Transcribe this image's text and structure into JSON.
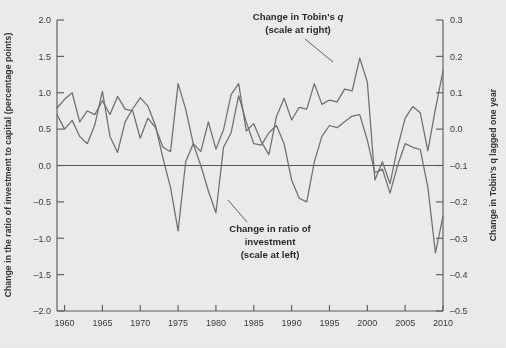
{
  "chart_data": {
    "type": "line",
    "title": "",
    "xlabel": "",
    "ylabel": "Change in the ratio of investment to capital (percentage points)",
    "y2label": "Change in Tobin's q lagged one year",
    "grid": false,
    "legend_position": "inline-annotations",
    "xlim": [
      1959,
      2010
    ],
    "ylim": [
      -2.0,
      2.0
    ],
    "y2lim": [
      -0.5,
      0.3
    ],
    "xticks": [
      1960,
      1965,
      1970,
      1975,
      1980,
      1985,
      1990,
      1995,
      2000,
      2005,
      2010
    ],
    "yticks": [
      -2.0,
      -1.5,
      -1.0,
      -0.5,
      0.0,
      0.5,
      1.0,
      1.5,
      2.0
    ],
    "yticklabels": [
      "-2.0",
      "-1.5",
      "-1.0",
      "-0.5",
      "0.0",
      "0.5",
      "1.0",
      "1.5",
      "2.0"
    ],
    "y2ticks": [
      -0.5,
      -0.4,
      -0.3,
      -0.2,
      -0.1,
      0.0,
      0.1,
      0.2,
      0.3
    ],
    "y2ticklabels": [
      "-0.5",
      "-0.4",
      "-0.3",
      "-0.2",
      "-0.1",
      "0.0",
      "0.1",
      "0.2",
      "0.3"
    ],
    "zero_line": 0.0,
    "line_color": "#6f6f70",
    "axis_color": "#5d5d5e",
    "background": "#ebebec",
    "series": [
      {
        "name": "Change in ratio of investment",
        "axis": "left",
        "x": [
          1959,
          1960,
          1961,
          1962,
          1963,
          1964,
          1965,
          1966,
          1967,
          1968,
          1969,
          1970,
          1971,
          1972,
          1973,
          1974,
          1975,
          1976,
          1977,
          1978,
          1979,
          1980,
          1981,
          1982,
          1983,
          1984,
          1985,
          1986,
          1987,
          1988,
          1989,
          1990,
          1991,
          1992,
          1993,
          1994,
          1995,
          1996,
          1997,
          1998,
          1999,
          2000,
          2001,
          2002,
          2003,
          2004,
          2005,
          2006,
          2007,
          2008,
          2009,
          2010
        ],
        "values": [
          0.7,
          0.5,
          0.62,
          0.4,
          0.3,
          0.56,
          1.02,
          0.4,
          0.18,
          0.6,
          0.78,
          0.93,
          0.82,
          0.55,
          0.1,
          -0.3,
          -0.9,
          0.05,
          0.3,
          0.0,
          -0.35,
          -0.65,
          0.25,
          0.45,
          0.96,
          0.6,
          0.3,
          0.28,
          0.45,
          0.55,
          0.3,
          -0.2,
          -0.45,
          -0.5,
          0.05,
          0.4,
          0.55,
          0.52,
          0.6,
          0.68,
          0.7,
          0.35,
          -0.1,
          -0.05,
          -0.38,
          0.0,
          0.3,
          0.25,
          0.22,
          -0.3,
          -1.2,
          -0.7
        ]
      },
      {
        "name": "Change in Tobin's q",
        "axis": "right",
        "x": [
          1959,
          1960,
          1961,
          1962,
          1963,
          1964,
          1965,
          1966,
          1967,
          1968,
          1969,
          1970,
          1971,
          1972,
          1973,
          1974,
          1975,
          1976,
          1977,
          1978,
          1979,
          1980,
          1981,
          1982,
          1983,
          1984,
          1985,
          1986,
          1987,
          1988,
          1989,
          1990,
          1991,
          1992,
          1993,
          1994,
          1995,
          1996,
          1997,
          1998,
          1999,
          2000,
          2001,
          2002,
          2003,
          2004,
          2005,
          2006,
          2007,
          2008,
          2009,
          2010
        ],
        "values": [
          0.58,
          0.82,
          1.0,
          0.2,
          0.5,
          0.4,
          0.78,
          0.4,
          0.9,
          0.55,
          0.5,
          -0.25,
          0.3,
          0.05,
          -0.5,
          -0.62,
          1.25,
          0.55,
          -0.4,
          -0.62,
          0.2,
          -0.55,
          -0.02,
          0.95,
          1.25,
          -0.05,
          0.15,
          -0.35,
          -0.7,
          0.35,
          0.85,
          0.25,
          0.6,
          0.55,
          1.25,
          0.68,
          0.8,
          0.75,
          1.1,
          1.05,
          1.95,
          1.3,
          -1.4,
          -0.9,
          -1.5,
          -0.5,
          0.3,
          0.62,
          0.45,
          -0.6,
          0.55,
          1.6
        ]
      }
    ],
    "annotations": [
      {
        "id": "tobins-q",
        "line1": "Change in Tobin's ",
        "emphasis": "q",
        "line2": "(scale at right)"
      },
      {
        "id": "investment",
        "line1": "Change in ratio of",
        "line2": "investment",
        "line3": "(scale at left)"
      }
    ]
  },
  "footer": {
    "cut_text": ""
  }
}
